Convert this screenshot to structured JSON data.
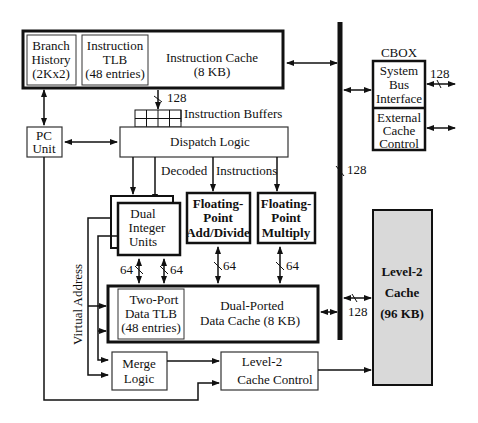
{
  "diagram": {
    "instruction_cache": {
      "label_line1": "Instruction  Cache",
      "label_line2": "(8 KB)",
      "branch_history": [
        "Branch",
        "History",
        "(2Kx2)"
      ],
      "instruction_tlb": [
        "Instruction",
        "TLB",
        "(48 entries)"
      ]
    },
    "fetch_width": "128",
    "instruction_buffers": "Instruction Buffers",
    "dispatch_logic": "Dispatch Logic",
    "decoded_instructions": [
      "Decoded",
      "Instructions"
    ],
    "pc_unit": [
      "PC",
      "Unit"
    ],
    "dual_integer_units": [
      "Dual",
      "Integer",
      "Units"
    ],
    "fp_add_divide": [
      "Floating-",
      "Point",
      "Add/Divide"
    ],
    "fp_multiply": [
      "Floating-",
      "Point",
      "Multiply"
    ],
    "bus_widths": {
      "int_left": "64",
      "int_right": "64",
      "fp_add": "64",
      "fp_mul": "64",
      "bus_mid": "128",
      "l2_link": "128",
      "system_bus": "128"
    },
    "data_cache": {
      "tlb": [
        "Two-Port",
        "Data TLB",
        "(48 entries)"
      ],
      "label": [
        "Dual-Ported",
        "Data Cache (8 KB)"
      ]
    },
    "virtual_address": "Virtual Address",
    "merge_logic": [
      "Merge",
      "Logic"
    ],
    "l2_cache_control": [
      "Level-2",
      "Cache Control"
    ],
    "cbox": {
      "title": "CBOX",
      "system_bus_interface": [
        "System",
        "Bus",
        "Interface"
      ],
      "external_cache_control": [
        "External",
        "Cache",
        "Control"
      ]
    },
    "level2_cache": [
      "Level-2",
      "Cache",
      "(96 KB)"
    ],
    "colors": {
      "line": "#111111",
      "l2_fill": "#d9d9d9"
    }
  }
}
